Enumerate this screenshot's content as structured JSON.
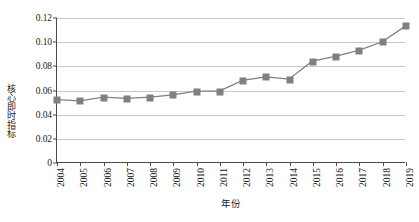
{
  "chart_data": {
    "type": "line",
    "title": "",
    "xlabel": "年份",
    "ylabel": "核心即时指标",
    "categories": [
      "2004",
      "2005",
      "2006",
      "2007",
      "2008",
      "2009",
      "2010",
      "2011",
      "2012",
      "2013",
      "2014",
      "2015",
      "2016",
      "2017",
      "2018",
      "2019"
    ],
    "values": [
      0.052,
      0.051,
      0.054,
      0.053,
      0.054,
      0.056,
      0.059,
      0.059,
      0.068,
      0.071,
      0.069,
      0.084,
      0.088,
      0.093,
      0.1,
      0.113
    ],
    "series": [
      {
        "name": "核心即时指标",
        "values": [
          0.052,
          0.051,
          0.054,
          0.053,
          0.054,
          0.056,
          0.059,
          0.059,
          0.068,
          0.071,
          0.069,
          0.084,
          0.088,
          0.093,
          0.1,
          0.113
        ]
      }
    ],
    "ylim": [
      0,
      0.12
    ],
    "yticks": [
      0,
      0.02,
      0.04,
      0.06,
      0.08,
      0.1,
      0.12
    ],
    "ytick_labels": [
      "0",
      "0.02",
      "0.04",
      "0.06",
      "0.08",
      "0.10",
      "0.12"
    ],
    "grid": true,
    "grid_axis": "y",
    "legend": false,
    "legend_position": "none",
    "marker": "square",
    "marker_color": "#808080",
    "line_color": "#808080",
    "axis_color": "#4a4a4a",
    "grid_color": "#c8c8c8",
    "xtick_rotation": -90
  }
}
